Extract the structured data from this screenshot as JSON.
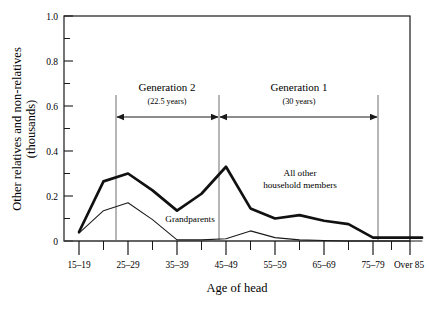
{
  "chart_data": {
    "type": "line",
    "title": "",
    "xlabel": "Age of head",
    "ylabel": "Other relatives and non-relatives (thousands)",
    "ylabel_line1": "Other relatives and non-relatives",
    "ylabel_line2": "(thousands)",
    "categories": [
      "15–19",
      "20–24",
      "25–29",
      "30–34",
      "35–39",
      "40–44",
      "45–49",
      "50–54",
      "55–59",
      "60–64",
      "65–69",
      "70–74",
      "75–79",
      "80–84",
      "Over 85"
    ],
    "xtick_labels": [
      "15–19",
      "25–29",
      "35–39",
      "45–49",
      "55–59",
      "65–69",
      "75–79",
      "Over 85"
    ],
    "ytick_labels": [
      "0",
      "0.2",
      "0.4",
      "0.6",
      "0.8",
      "1.0"
    ],
    "ytick_values": [
      0,
      0.2,
      0.4,
      0.6,
      0.8,
      1.0
    ],
    "yminor_values": [
      0.1,
      0.3,
      0.5,
      0.7,
      0.9
    ],
    "ylim": [
      0,
      1.0
    ],
    "grid": false,
    "legend_position": "inline-annotations",
    "series": [
      {
        "name": "All other household members",
        "style": "thick",
        "values": [
          0.04,
          0.265,
          0.3,
          0.225,
          0.135,
          0.21,
          0.33,
          0.145,
          0.1,
          0.115,
          0.09,
          0.075,
          0.015,
          0.015,
          0.015
        ]
      },
      {
        "name": "Grandparents",
        "style": "thin",
        "values": [
          0.035,
          0.135,
          0.17,
          0.095,
          0.005,
          0.005,
          0.01,
          0.045,
          0.015,
          0.005,
          0.002,
          0.0,
          0.0,
          0.0,
          0.0
        ]
      }
    ],
    "annotations": [
      {
        "name": "generation-2",
        "title": "Generation 2",
        "subtitle": "(22.5 years)",
        "from_index": 2,
        "to_index": 6
      },
      {
        "name": "generation-1",
        "title": "Generation 1",
        "subtitle": "(30 years)",
        "from_index": 6,
        "to_index": 12
      }
    ],
    "series_labels": [
      {
        "name": "all-other-household-members",
        "line1": "All other",
        "line2": "household members"
      },
      {
        "name": "grandparents",
        "line1": "Grandparents",
        "line2": ""
      }
    ]
  }
}
